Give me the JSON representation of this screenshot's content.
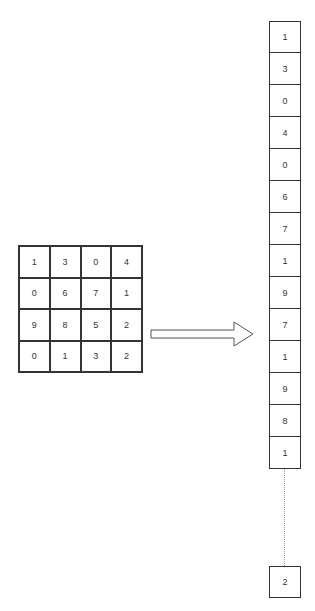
{
  "matrix": {
    "rows": [
      [
        "1",
        "3",
        "0",
        "4"
      ],
      [
        "0",
        "6",
        "7",
        "1"
      ],
      [
        "9",
        "8",
        "5",
        "2"
      ],
      [
        "0",
        "1",
        "3",
        "2"
      ]
    ]
  },
  "arrow": {
    "direction": "right",
    "label": ""
  },
  "flattened": {
    "values": [
      "1",
      "3",
      "0",
      "4",
      "0",
      "6",
      "7",
      "1",
      "9",
      "7",
      "1",
      "9",
      "8",
      "1"
    ],
    "ellipsis": "dotted-line",
    "last": "2"
  }
}
